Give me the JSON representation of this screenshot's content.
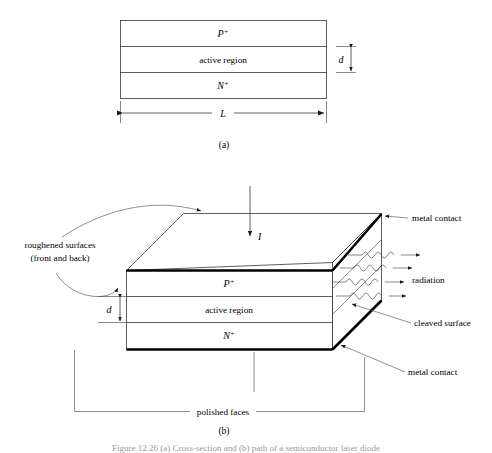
{
  "figure": {
    "caption_truncated": "Figure 12.26  (a) Cross-section and (b) path of a semiconductor laser diode",
    "part_a_label": "(a)",
    "part_b_label": "(b)"
  },
  "part_a": {
    "layers": [
      {
        "name": "p-plus-layer",
        "text": "P",
        "sup": "+"
      },
      {
        "name": "active-region-layer",
        "text": "active region",
        "sup": ""
      },
      {
        "name": "n-plus-layer",
        "text": "N",
        "sup": "+"
      }
    ],
    "dim_thickness": "d",
    "dim_length": "L"
  },
  "part_b": {
    "layers": [
      {
        "name": "p-plus-layer",
        "text": "P",
        "sup": "+"
      },
      {
        "name": "active-region-layer",
        "text": "active region",
        "sup": ""
      },
      {
        "name": "n-plus-layer",
        "text": "N",
        "sup": "+"
      }
    ],
    "dim_thickness": "d",
    "current_label": "I",
    "callouts": {
      "roughened_line1": "roughened surfaces",
      "roughened_line2": "(front and back)",
      "metal_contact_top": "metal contact",
      "radiation": "radiation",
      "cleaved_surface": "cleaved surface",
      "metal_contact_bottom": "metal contact",
      "polished_faces": "polished faces"
    }
  },
  "colors": {
    "ink": "#000000",
    "line": "#1a1a1a",
    "leader": "#444444",
    "background": "#ffffff"
  }
}
